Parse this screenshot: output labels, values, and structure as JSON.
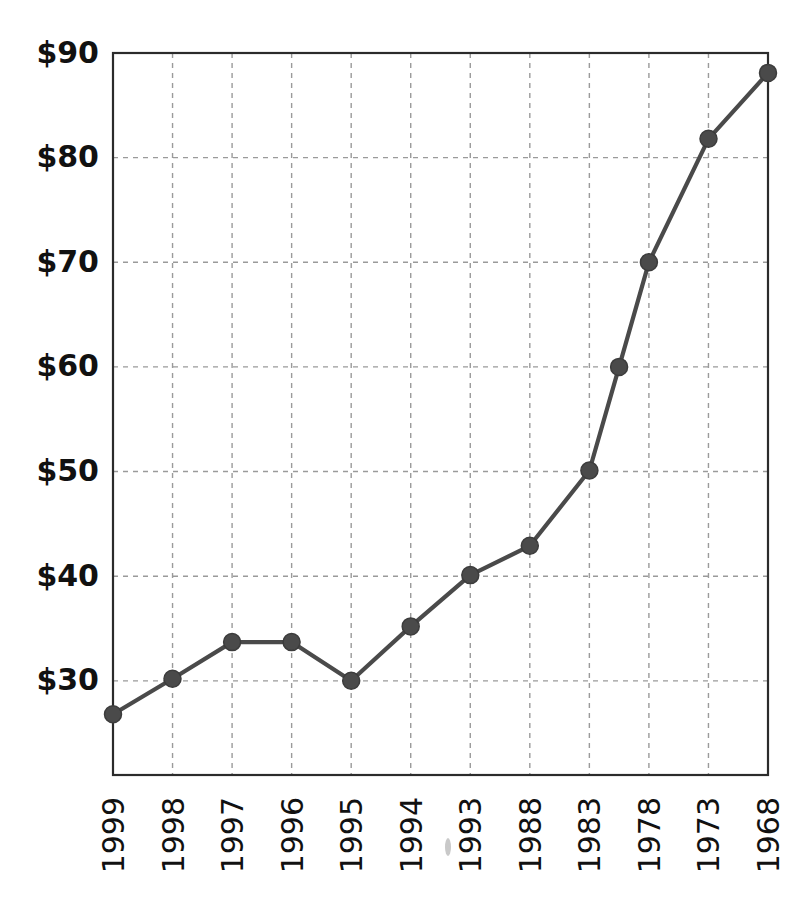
{
  "page": {
    "background_color": "#ffffff",
    "clipped_header_text": ""
  },
  "chart_data": {
    "type": "line",
    "title": "",
    "subtitle": "",
    "xlabel": "",
    "ylabel": "",
    "categories": [
      "1999",
      "1998",
      "1997",
      "1996",
      "1995",
      "1994",
      "1993",
      "1988",
      "1983",
      "",
      "1978",
      "1973",
      "1968"
    ],
    "values": [
      26.8,
      30.2,
      33.7,
      33.7,
      30.0,
      35.2,
      40.1,
      42.9,
      50.1,
      60.0,
      70.0,
      81.8,
      88.1
    ],
    "series": [
      {
        "name": "",
        "values": [
          26.8,
          30.2,
          33.7,
          33.7,
          30.0,
          35.2,
          40.1,
          42.9,
          50.1,
          60.0,
          70.0,
          81.8,
          88.1
        ]
      }
    ],
    "ylim": [
      21.0,
      90.0
    ],
    "ytick_values": [
      30,
      40,
      50,
      60,
      70,
      80,
      90
    ],
    "ytick_labels": [
      "$30",
      "$40",
      "$50",
      "$60",
      "$70",
      "$80",
      "$90"
    ],
    "xtick_labels": [
      "1999",
      "1998",
      "1997",
      "1996",
      "1995",
      "1994",
      "1993",
      "1988",
      "1983",
      "1978",
      "1973",
      "1968"
    ],
    "xtick_rotation": 90,
    "grid": true,
    "grid_style": "dashed",
    "grid_color": "#9a9a9a",
    "legend": false,
    "legend_position": "none",
    "line_color": "#4a4a4a",
    "marker_color": "#4a4a4a",
    "marker_shape": "circle",
    "frame_color": "#2b2b2b",
    "annotations": []
  }
}
